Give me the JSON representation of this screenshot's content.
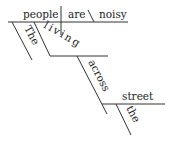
{
  "diagram": {
    "type": "sentence-diagram",
    "sentence": "The people living across the street are noisy",
    "words": {
      "subject": "people",
      "verb": "are",
      "predicate_adjective": "noisy",
      "article_subject": "The",
      "participle": "living",
      "preposition": "across",
      "object": "street",
      "article_object": "the"
    },
    "colors": {
      "line": "#333333",
      "text": "#222222",
      "background": "#ffffff"
    }
  }
}
